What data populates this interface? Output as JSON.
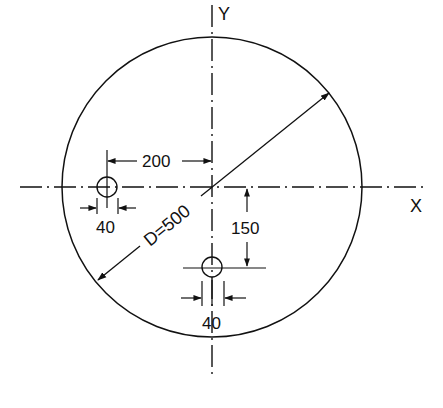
{
  "diagram": {
    "type": "engineering-drawing",
    "axes": {
      "x_label": "X",
      "y_label": "Y"
    },
    "plate": {
      "shape": "circle",
      "diameter_label": "D=500",
      "diameter": 500
    },
    "holes": [
      {
        "name": "left-hole",
        "diameter": 40,
        "diameter_label": "40",
        "offset_label": "200",
        "offset_from_y_axis": 200
      },
      {
        "name": "bottom-hole",
        "diameter": 40,
        "diameter_label": "40",
        "offset_label": "150",
        "offset_from_x_axis": 150
      }
    ],
    "colors": {
      "line": "#111111",
      "background": "#ffffff"
    }
  }
}
